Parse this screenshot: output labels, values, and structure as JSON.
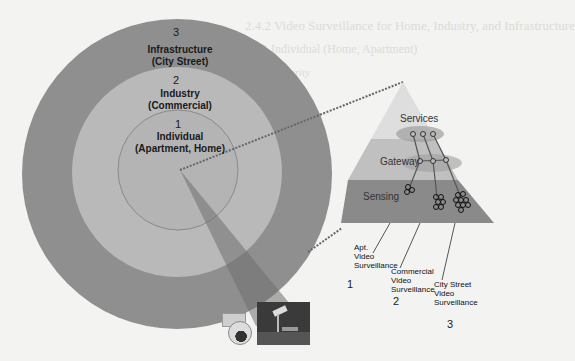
{
  "background_text": [
    "2.4.2  Video Surveillance for Home, Industry, and Infrastructure",
    "2.4.2.1  Individual (Home, Apartment)",
    "Home Security"
  ],
  "rings": [
    {
      "number": "3",
      "title": "Infrastructure",
      "subtitle": "(City Street)",
      "color": "#8d8d8d"
    },
    {
      "number": "2",
      "title": "Industry",
      "subtitle": "(Commercial)",
      "color": "#b7b7b7"
    },
    {
      "number": "1",
      "title": "Individual",
      "subtitle": "(Apartment, Home)",
      "color": "#b3b3b3"
    }
  ],
  "pyramid": {
    "layers": [
      {
        "label": "Services",
        "color": "#dcdcdc"
      },
      {
        "label": "Gateway",
        "color": "#bdbdbd"
      },
      {
        "label": "Sensing",
        "color": "#888888"
      }
    ]
  },
  "captions": [
    {
      "lines": [
        "Apt.",
        "Video",
        "Surveillance"
      ],
      "number": "1"
    },
    {
      "lines": [
        "Commercial",
        "Video",
        "Surveillance"
      ],
      "number": "2"
    },
    {
      "lines": [
        "City Street",
        "Video",
        "Surveillance"
      ],
      "number": "3"
    }
  ],
  "images": [
    "dome-camera",
    "street-camera-photo"
  ]
}
